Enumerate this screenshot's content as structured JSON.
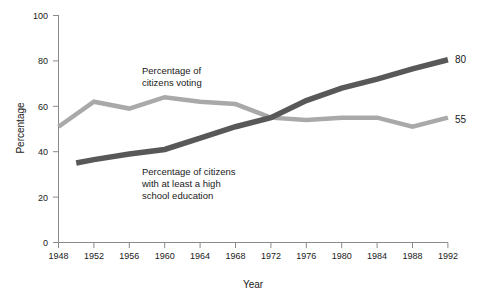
{
  "chart_data": {
    "type": "line",
    "title": "",
    "xlabel": "Year",
    "ylabel": "Percentage",
    "xlim": [
      1948,
      1992
    ],
    "ylim": [
      0,
      100
    ],
    "grid": false,
    "legend_position": "inline-annotations",
    "x_ticks": [
      "1948",
      "1952",
      "1956",
      "1960",
      "1964",
      "1968",
      "1972",
      "1976",
      "1980",
      "1984",
      "1988",
      "1992"
    ],
    "y_ticks": [
      "0",
      "20",
      "40",
      "60",
      "80",
      "100"
    ],
    "series": [
      {
        "name": "Percentage of citizens voting",
        "color": "#a9a9a9",
        "x": [
          1948,
          1952,
          1956,
          1960,
          1964,
          1968,
          1972,
          1976,
          1980,
          1984,
          1988,
          1992
        ],
        "values": [
          51,
          62,
          59,
          64,
          62,
          61,
          55,
          54,
          55,
          55,
          51,
          55
        ],
        "end_label": "55",
        "annotation": "Percentage of\ncitizens voting",
        "annotation_lines": [
          "Percentage of",
          "citizens voting"
        ]
      },
      {
        "name": "Percentage of citizens with at least a high school education",
        "color": "#585858",
        "x": [
          1950,
          1952,
          1956,
          1960,
          1964,
          1968,
          1972,
          1976,
          1980,
          1984,
          1988,
          1992
        ],
        "values": [
          35,
          36.5,
          39,
          41,
          46,
          51,
          55,
          62.5,
          68,
          72,
          76.5,
          80.5
        ],
        "end_label": "80",
        "annotation": "Percentage of citizens\nwith at least a high\nschool education",
        "annotation_lines": [
          "Percentage of citizens",
          "with at least a high",
          "school education"
        ]
      }
    ]
  },
  "axes": {
    "y_title": "Percentage",
    "x_title": "Year",
    "y_tick_labels": [
      "100",
      "80",
      "60",
      "40",
      "20",
      "0"
    ],
    "x_tick_labels": [
      "1948",
      "1952",
      "1956",
      "1960",
      "1964",
      "1968",
      "1972",
      "1976",
      "1980",
      "1984",
      "1988",
      "1992"
    ]
  },
  "annotations": {
    "voting": {
      "line1": "Percentage of",
      "line2": "citizens voting"
    },
    "education": {
      "line1": "Percentage of citizens",
      "line2": "with at least a high",
      "line3": "school education"
    },
    "end_label_education": "80",
    "end_label_voting": "55"
  },
  "colors": {
    "voting_line": "#a9a9a9",
    "education_line": "#585858",
    "axis": "#8a8a8a",
    "text": "#1a1a1a",
    "background": "#ffffff"
  }
}
